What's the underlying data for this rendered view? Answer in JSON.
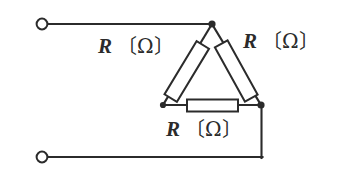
{
  "figure": {
    "type": "circuit-schematic",
    "width": 338,
    "height": 179,
    "background_color": "#ffffff",
    "line_color": "#2b2b2b"
  },
  "labels": {
    "left_resistor": {
      "symbol": "R",
      "unit": "〔Ω〕",
      "full": "R 〔Ω〕"
    },
    "right_resistor": {
      "symbol": "R",
      "unit": "〔Ω〕",
      "full": "R 〔Ω〕"
    },
    "bottom_resistor": {
      "symbol": "R",
      "unit": "〔Ω〕",
      "full": "R 〔Ω〕"
    }
  },
  "terminals": [
    {
      "name": "top-terminal",
      "cx": 42,
      "cy": 24,
      "r": 5.5
    },
    {
      "name": "bottom-terminal",
      "cx": 42,
      "cy": 157,
      "r": 5.5
    }
  ],
  "nodes": [
    {
      "name": "apex-node",
      "cx": 212,
      "cy": 24,
      "r": 3.4
    },
    {
      "name": "bottom-left-node",
      "cx": 163,
      "cy": 105,
      "r": 3.0
    },
    {
      "name": "bottom-right-node",
      "cx": 261,
      "cy": 105,
      "r": 3.4
    }
  ],
  "wires": [
    {
      "name": "top-lead",
      "points": "47.5,24 212,24"
    },
    {
      "name": "bottom-lead",
      "points": "47.5,157 261.5,157"
    },
    {
      "name": "right-riser",
      "points": "261.5,157 261.5,105"
    },
    {
      "name": "delta-left-edge",
      "points": "212,24 163,105"
    },
    {
      "name": "delta-right-edge",
      "points": "212,24 261,105"
    },
    {
      "name": "delta-bottom-edge",
      "points": "163,105 261,105"
    }
  ],
  "resistors": [
    {
      "name": "resistor-left",
      "orientation": "diagonal",
      "x": 179.5,
      "y": 40.5,
      "w": 14.5,
      "h": 62,
      "rotation_deg": 31.2,
      "cx": 186.7,
      "cy": 71.5
    },
    {
      "name": "resistor-right",
      "orientation": "diagonal",
      "x": 229.0,
      "y": 40.0,
      "w": 14.5,
      "h": 62,
      "rotation_deg": -29.0,
      "cx": 236.2,
      "cy": 71.0
    },
    {
      "name": "resistor-bottom",
      "orientation": "horizontal",
      "x": 187,
      "y": 99.5,
      "w": 51,
      "h": 12,
      "rotation_deg": 0,
      "cx": 212.5,
      "cy": 105.5
    }
  ]
}
